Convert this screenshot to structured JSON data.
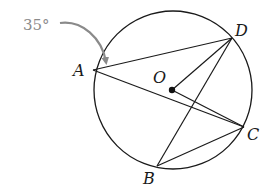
{
  "diagram": {
    "type": "circle-geometry",
    "circle": {
      "center": "O",
      "cx": 173,
      "cy": 90,
      "r": 79
    },
    "points": [
      {
        "id": "A",
        "label": "A",
        "x": 93,
        "y": 70,
        "label_x": 73,
        "label_y": 76
      },
      {
        "id": "D",
        "label": "D",
        "x": 232,
        "y": 38,
        "label_x": 235,
        "label_y": 36
      },
      {
        "id": "O",
        "label": "O",
        "x": 172,
        "y": 90,
        "label_x": 153,
        "label_y": 83
      },
      {
        "id": "C",
        "label": "C",
        "x": 244,
        "y": 127,
        "label_x": 247,
        "label_y": 140
      },
      {
        "id": "B",
        "label": "B",
        "x": 157,
        "y": 166,
        "label_x": 143,
        "label_y": 184
      }
    ],
    "segments": [
      [
        "A",
        "D"
      ],
      [
        "A",
        "C"
      ],
      [
        "D",
        "O"
      ],
      [
        "O",
        "C"
      ],
      [
        "D",
        "B"
      ],
      [
        "B",
        "C"
      ]
    ],
    "angle_annotation": {
      "text": "35°",
      "at_vertex": "A",
      "color": "#8a8a8a"
    },
    "colors": {
      "line": "#1a1a1a",
      "annotation": "#8a8a8a",
      "background": "#ffffff"
    }
  }
}
